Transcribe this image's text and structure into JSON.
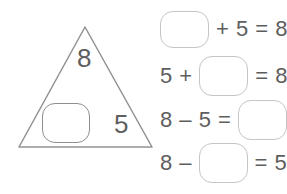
{
  "colors": {
    "background": "#ffffff",
    "ink": "#5e5e5e",
    "triangle_stroke": "#929292",
    "triangle_box_border": "#8e8e8e",
    "equation_box_border": "#c5c5c5"
  },
  "fact_triangle": {
    "top_number": "8",
    "right_number": "5",
    "left_slot": ""
  },
  "equations": [
    {
      "after": "+ 5 = 8"
    },
    {
      "before": "5 +",
      "after": "= 8"
    },
    {
      "before": "8 – 5 ="
    },
    {
      "before": "8 –",
      "after": "= 5"
    }
  ]
}
